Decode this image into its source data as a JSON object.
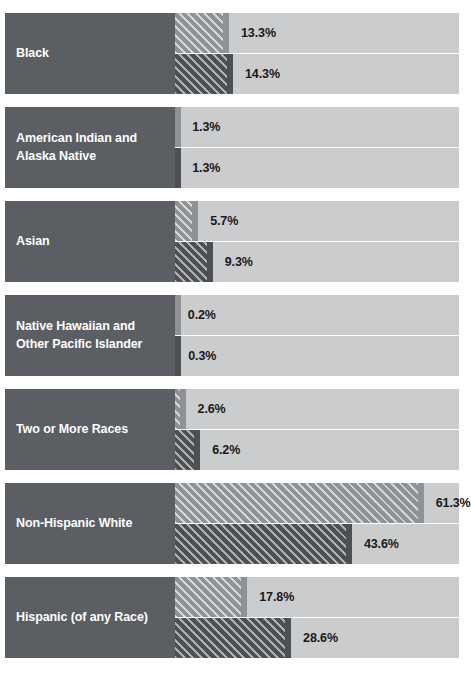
{
  "chart_data": {
    "type": "bar",
    "title": "",
    "subtitle": "",
    "xlabel": "",
    "ylabel": "",
    "orientation": "horizontal",
    "grid": false,
    "legend_position": "none",
    "xlim": [
      0,
      70
    ],
    "axis_max_percent": 70,
    "value_suffix": "%",
    "categories": [
      "Black",
      "American Indian and\nAlaska Native",
      "Asian",
      "Native Hawaiian and\nOther Pacific Islander",
      "Two or More Races",
      "Non-Hispanic White",
      "Hispanic (of any Race)"
    ],
    "series": [
      {
        "name": "upper",
        "values": [
          13.3,
          1.3,
          5.7,
          0.2,
          2.6,
          61.3,
          17.8
        ],
        "labels": [
          "13.3%",
          "1.3%",
          "5.7%",
          "0.2%",
          "2.6%",
          "61.3%",
          "17.8%"
        ],
        "color": "#8e9195",
        "hatch": "diagonal"
      },
      {
        "name": "lower",
        "values": [
          14.3,
          1.3,
          9.3,
          0.3,
          6.2,
          43.6,
          28.6
        ],
        "labels": [
          "14.3%",
          "1.3%",
          "9.3%",
          "0.3%",
          "6.2%",
          "43.6%",
          "28.6%"
        ],
        "color": "#4c4f53",
        "hatch": "diagonal"
      }
    ]
  },
  "colors": {
    "label_block": "#5b5e62",
    "track": "#cbcccd",
    "series_upper": "#8e9195",
    "series_lower": "#4c4f53",
    "value_text": "#19191b",
    "label_text": "#ffffff",
    "background": "#ffffff"
  }
}
